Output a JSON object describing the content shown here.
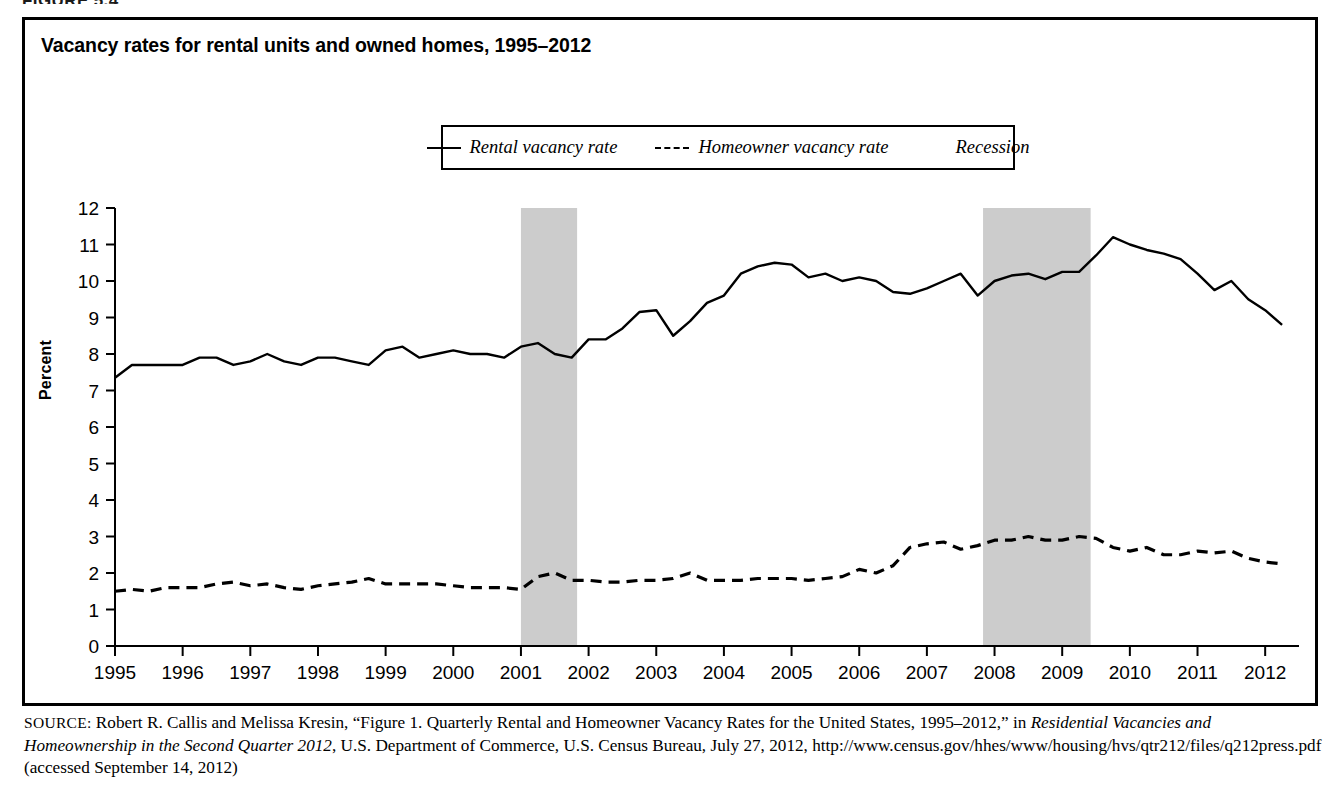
{
  "figure": {
    "kicker": "FIGURE 5.4",
    "title": "Vacancy rates for rental units and owned homes, 1995–2012"
  },
  "legend": {
    "items": [
      {
        "label": "Rental vacancy rate",
        "marker": "solid-line-swatch",
        "color": "#000000"
      },
      {
        "label": "Homeowner vacancy rate",
        "marker": "dashed-line-swatch",
        "color": "#000000"
      },
      {
        "label": "Recession",
        "marker": "gray-box-swatch",
        "color": "#cccccc"
      }
    ]
  },
  "source": {
    "kicker": "SOURCE:",
    "text_1": " Robert R. Callis and Melissa Kresin, “Figure 1. Quarterly Rental and Homeowner Vacancy Rates for the United States, 1995–2012,” in ",
    "italic_1": "Residential Vacancies and Homeownership in the Second Quarter 2012",
    "text_2": ", U.S. Department of Commerce, U.S. Census Bureau, July 27, 2012, http://www.census.gov/",
    "text_3": "hhes/www/housing/hvs/qtr212/files/q212press.pdf (accessed September 14, 2012)"
  },
  "chart_data": {
    "type": "line",
    "title": "Vacancy rates for rental units and owned homes, 1995–2012",
    "xlabel": "",
    "ylabel": "Percent",
    "ylim": [
      0,
      12
    ],
    "xlim": [
      1995,
      2012.5
    ],
    "ytick_labels": [
      "0",
      "1",
      "2",
      "3",
      "4",
      "5",
      "6",
      "7",
      "8",
      "9",
      "10",
      "11",
      "12"
    ],
    "yticks": [
      0,
      1,
      2,
      3,
      4,
      5,
      6,
      7,
      8,
      9,
      10,
      11,
      12
    ],
    "xtick_labels": [
      "1995",
      "1996",
      "1997",
      "1998",
      "1999",
      "2000",
      "2001",
      "2002",
      "2003",
      "2004",
      "2005",
      "2006",
      "2007",
      "2008",
      "2009",
      "2010",
      "2011",
      "2012"
    ],
    "xticks": [
      1995,
      1996,
      1997,
      1998,
      1999,
      2000,
      2001,
      2002,
      2003,
      2004,
      2005,
      2006,
      2007,
      2008,
      2009,
      2010,
      2011,
      2012
    ],
    "grid": false,
    "legend_position": "top-center",
    "x": [
      1995.0,
      1995.25,
      1995.5,
      1995.75,
      1996.0,
      1996.25,
      1996.5,
      1996.75,
      1997.0,
      1997.25,
      1997.5,
      1997.75,
      1998.0,
      1998.25,
      1998.5,
      1998.75,
      1999.0,
      1999.25,
      1999.5,
      1999.75,
      2000.0,
      2000.25,
      2000.5,
      2000.75,
      2001.0,
      2001.25,
      2001.5,
      2001.75,
      2002.0,
      2002.25,
      2002.5,
      2002.75,
      2003.0,
      2003.25,
      2003.5,
      2003.75,
      2004.0,
      2004.25,
      2004.5,
      2004.75,
      2005.0,
      2005.25,
      2005.5,
      2005.75,
      2006.0,
      2006.25,
      2006.5,
      2006.75,
      2007.0,
      2007.25,
      2007.5,
      2007.75,
      2008.0,
      2008.25,
      2008.5,
      2008.75,
      2009.0,
      2009.25,
      2009.5,
      2009.75,
      2010.0,
      2010.25,
      2010.5,
      2010.75,
      2011.0,
      2011.25,
      2011.5,
      2011.75,
      2012.0,
      2012.25
    ],
    "series": [
      {
        "name": "Rental vacancy rate",
        "style": "solid",
        "color": "#000000",
        "values": [
          7.35,
          7.7,
          7.7,
          7.7,
          7.7,
          7.9,
          7.9,
          7.7,
          7.8,
          8.0,
          7.8,
          7.7,
          7.9,
          7.9,
          7.8,
          7.7,
          8.1,
          8.2,
          7.9,
          8.0,
          8.1,
          8.0,
          8.0,
          7.9,
          8.2,
          8.3,
          8.0,
          7.9,
          8.4,
          8.4,
          8.7,
          9.15,
          9.2,
          8.5,
          8.9,
          9.4,
          9.6,
          10.2,
          10.4,
          10.5,
          10.45,
          10.1,
          10.2,
          10.0,
          10.1,
          10.0,
          9.7,
          9.65,
          9.8,
          10.0,
          10.2,
          9.6,
          10.0,
          10.15,
          10.2,
          10.05,
          10.25,
          10.25,
          10.7,
          11.2,
          11.0,
          10.85,
          10.75,
          10.6,
          10.2,
          9.75,
          10.0,
          9.5,
          9.2,
          8.8
        ]
      },
      {
        "name": "Homeowner vacancy rate",
        "style": "dashed",
        "color": "#000000",
        "values": [
          1.5,
          1.55,
          1.5,
          1.6,
          1.6,
          1.6,
          1.7,
          1.75,
          1.65,
          1.7,
          1.6,
          1.55,
          1.65,
          1.7,
          1.75,
          1.85,
          1.7,
          1.7,
          1.7,
          1.7,
          1.65,
          1.6,
          1.6,
          1.6,
          1.55,
          1.9,
          2.0,
          1.8,
          1.8,
          1.75,
          1.75,
          1.8,
          1.8,
          1.85,
          2.0,
          1.8,
          1.8,
          1.8,
          1.85,
          1.85,
          1.85,
          1.8,
          1.85,
          1.9,
          2.1,
          2.0,
          2.2,
          2.7,
          2.8,
          2.85,
          2.65,
          2.75,
          2.9,
          2.9,
          3.0,
          2.9,
          2.9,
          3.0,
          2.95,
          2.7,
          2.6,
          2.7,
          2.5,
          2.5,
          2.6,
          2.55,
          2.6,
          2.4,
          2.3,
          2.25
        ]
      }
    ],
    "recession_bands": [
      {
        "label": "2001 recession",
        "start": 2001.0,
        "end": 2001.83,
        "color": "#cccccc"
      },
      {
        "label": "2007-2009 recession",
        "start": 2007.83,
        "end": 2009.42,
        "color": "#cccccc"
      }
    ]
  }
}
